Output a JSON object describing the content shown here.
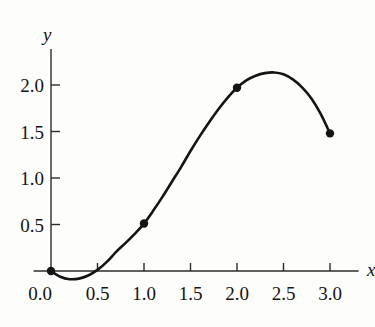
{
  "figure": {
    "background_color": "#fdfdfc",
    "ink_color": "#141414",
    "axis_color": "#2b2b2b"
  },
  "axis_labels": {
    "x": "x",
    "y": "y"
  },
  "chart_data": {
    "type": "line",
    "title": "",
    "subtitle": "",
    "xlabel": "x",
    "ylabel": "y",
    "xlim": [
      -0.18,
      3.3
    ],
    "ylim": [
      -0.22,
      2.38
    ],
    "xticks": [
      0.0,
      0.5,
      1.0,
      1.5,
      2.0,
      2.5,
      3.0
    ],
    "xtick_labels": [
      "0.0",
      "0.5",
      "1.0",
      "1.5",
      "2.0",
      "2.5",
      "3.0"
    ],
    "yticks": [
      0.5,
      1.0,
      1.5,
      2.0
    ],
    "ytick_labels": [
      "0.5",
      "1.0",
      "1.5",
      "2.0"
    ],
    "grid": false,
    "legend": null,
    "series": [
      {
        "name": "interpolating curve",
        "style": "solid",
        "color": "#141414",
        "linewidth": 2.6,
        "x": [
          0.0,
          0.1,
          0.2,
          0.3,
          0.4,
          0.5,
          0.6,
          0.7,
          0.8,
          0.9,
          1.0,
          1.1,
          1.2,
          1.3,
          1.4,
          1.5,
          1.6,
          1.7,
          1.8,
          1.9,
          2.0,
          2.1,
          2.2,
          2.3,
          2.4,
          2.5,
          2.6,
          2.7,
          2.8,
          2.9,
          3.0
        ],
        "y": [
          0.0,
          -0.062,
          -0.088,
          -0.082,
          -0.048,
          0.012,
          0.098,
          0.205,
          0.3,
          0.4,
          0.51,
          0.65,
          0.8,
          0.96,
          1.12,
          1.29,
          1.45,
          1.6,
          1.74,
          1.865,
          1.97,
          2.05,
          2.1,
          2.128,
          2.135,
          2.115,
          2.06,
          1.975,
          1.855,
          1.69,
          1.48
        ]
      }
    ],
    "markers": {
      "name": "data points",
      "shape": "filled-circle",
      "color": "#141414",
      "radius": 4.2,
      "points": [
        {
          "x": 0.0,
          "y": 0.0
        },
        {
          "x": 1.0,
          "y": 0.51
        },
        {
          "x": 2.0,
          "y": 1.97
        },
        {
          "x": 3.0,
          "y": 1.48
        }
      ]
    },
    "annotations": [
      {
        "text": "curve dips slightly below the x-axis between x=0 and x≈0.45",
        "visible": false
      }
    ]
  }
}
